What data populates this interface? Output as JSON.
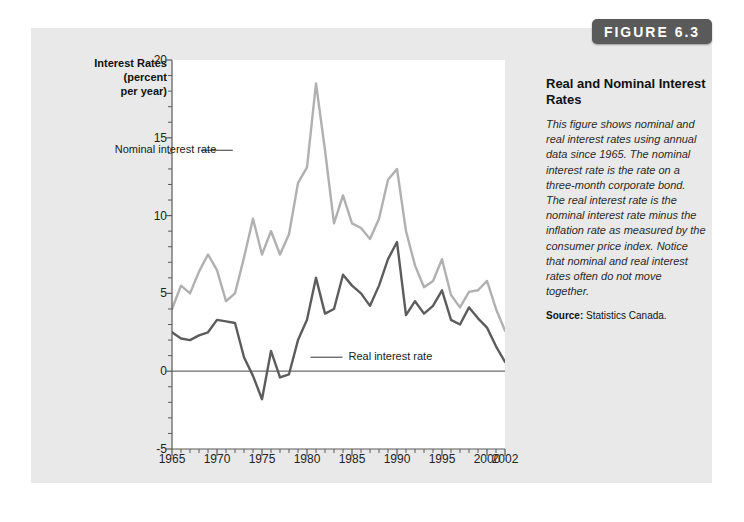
{
  "badge": {
    "label": "FIGURE 6.3"
  },
  "side": {
    "title": "Real and Nominal Interest Rates",
    "body": "This figure shows nominal and real interest rates using annual data since 1965. The nominal interest rate is the rate on a three-month corporate bond. The real interest rate is the nominal interest rate minus the inflation rate as measured by the consumer price index. Notice that nominal and real interest rates often do not move together.",
    "source_label": "Source:",
    "source_value": "Statistics Canada."
  },
  "colors": {
    "panel_bg": "#e9e9e9",
    "badge_bg": "#5a5a5a",
    "nominal_line": "#b0b0b0",
    "real_line": "#5c5c5c",
    "axis": "#5a5a5a",
    "zero_line": "#6b6b6b"
  },
  "chart_data": {
    "type": "line",
    "title": "Real and Nominal Interest Rates",
    "xlabel": "",
    "ylabel": "Interest Rates (percent per year)",
    "ylabel_lines": [
      "Interest Rates",
      "(percent",
      "per year)"
    ],
    "xlim": [
      1965,
      2002
    ],
    "ylim": [
      -5,
      20
    ],
    "yticks": [
      20,
      15,
      10,
      5,
      0,
      -5
    ],
    "ytick_labels": [
      "20",
      "15",
      "10",
      "5",
      "0",
      "-5"
    ],
    "y_minor_step": 1,
    "xticks": [
      1965,
      1970,
      1975,
      1980,
      1985,
      1990,
      1995,
      2000,
      2002
    ],
    "xtick_labels": [
      "1965",
      "1970",
      "1975",
      "1980",
      "1985",
      "1990",
      "1995",
      "2000",
      "2002"
    ],
    "x_minor_step": 1,
    "grid": false,
    "legend": "inline-annotations",
    "annotations": [
      {
        "text": "Nominal interest rate",
        "series": "Nominal interest rate",
        "x": 1970.2,
        "y": 14.2
      },
      {
        "text": "Real interest rate",
        "series": "Real interest rate",
        "x": 1983.5,
        "y": 0.9
      }
    ],
    "x": [
      1965,
      1966,
      1967,
      1968,
      1969,
      1970,
      1971,
      1972,
      1973,
      1974,
      1975,
      1976,
      1977,
      1978,
      1979,
      1980,
      1981,
      1982,
      1983,
      1984,
      1985,
      1986,
      1987,
      1988,
      1989,
      1990,
      1991,
      1992,
      1993,
      1994,
      1995,
      1996,
      1997,
      1998,
      1999,
      2000,
      2001,
      2002
    ],
    "series": [
      {
        "name": "Nominal interest rate",
        "color": "#b0b0b0",
        "values": [
          4.0,
          5.5,
          5.0,
          6.4,
          7.5,
          6.5,
          4.5,
          5.0,
          7.3,
          9.8,
          7.5,
          9.0,
          7.5,
          8.8,
          12.1,
          13.1,
          18.5,
          14.2,
          9.5,
          11.3,
          9.5,
          9.2,
          8.5,
          9.8,
          12.3,
          13.0,
          9.0,
          6.8,
          5.4,
          5.8,
          7.2,
          4.9,
          4.1,
          5.1,
          5.2,
          5.8,
          4.0,
          2.6
        ]
      },
      {
        "name": "Real interest rate",
        "color": "#5c5c5c",
        "values": [
          2.5,
          2.1,
          2.0,
          2.3,
          2.5,
          3.3,
          3.2,
          3.1,
          0.9,
          -0.3,
          -1.8,
          1.3,
          -0.4,
          -0.2,
          2.0,
          3.3,
          6.0,
          3.7,
          4.0,
          6.2,
          5.5,
          5.0,
          4.2,
          5.5,
          7.2,
          8.3,
          3.6,
          4.5,
          3.7,
          4.2,
          5.2,
          3.3,
          3.0,
          4.1,
          3.4,
          2.8,
          1.6,
          0.6
        ]
      }
    ]
  }
}
